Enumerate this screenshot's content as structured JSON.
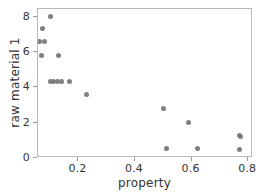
{
  "chart_data": {
    "type": "scatter",
    "title": "",
    "xlabel": "property",
    "ylabel": "raw material 1",
    "xlim": [
      0.057,
      0.817
    ],
    "ylim": [
      0,
      8.45
    ],
    "xticks": [
      0.2,
      0.4,
      0.6,
      0.8
    ],
    "xticklabels": [
      "0.2",
      "0.4",
      "0.6",
      "0.8"
    ],
    "yticks": [
      0,
      2,
      4,
      6,
      8
    ],
    "yticklabels": [
      "0",
      "2",
      "4",
      "6",
      "8"
    ],
    "grid": false,
    "legend": null,
    "marker_color": "#7f7f7f",
    "marker_size": 5,
    "points": [
      {
        "x": 0.1,
        "y": 8.05
      },
      {
        "x": 0.073,
        "y": 7.33
      },
      {
        "x": 0.063,
        "y": 6.6
      },
      {
        "x": 0.08,
        "y": 6.6
      },
      {
        "x": 0.068,
        "y": 5.82
      },
      {
        "x": 0.13,
        "y": 5.82
      },
      {
        "x": 0.1,
        "y": 4.32
      },
      {
        "x": 0.112,
        "y": 4.32
      },
      {
        "x": 0.127,
        "y": 4.32
      },
      {
        "x": 0.14,
        "y": 4.32
      },
      {
        "x": 0.168,
        "y": 4.32
      },
      {
        "x": 0.23,
        "y": 3.6
      },
      {
        "x": 0.5,
        "y": 2.78
      },
      {
        "x": 0.59,
        "y": 2.03
      },
      {
        "x": 0.768,
        "y": 1.27
      },
      {
        "x": 0.772,
        "y": 1.24
      },
      {
        "x": 0.512,
        "y": 0.55
      },
      {
        "x": 0.622,
        "y": 0.55
      },
      {
        "x": 0.77,
        "y": 0.5
      }
    ]
  }
}
